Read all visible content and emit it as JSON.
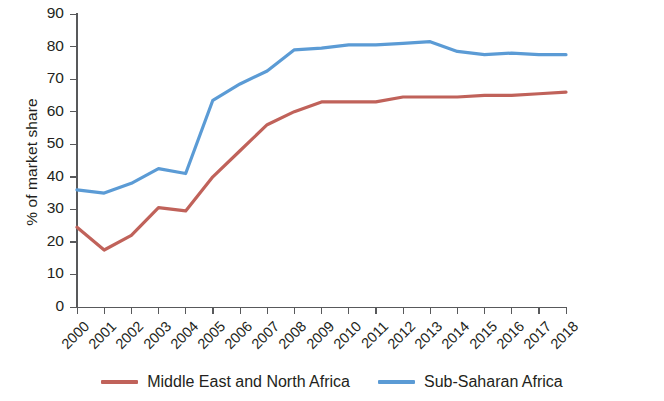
{
  "chart_data": {
    "type": "line",
    "title": "",
    "xlabel": "",
    "ylabel": "% of market share",
    "ylim": [
      0,
      90
    ],
    "ytick_step": 10,
    "yticks": [
      0,
      10,
      20,
      30,
      40,
      50,
      60,
      70,
      80,
      90
    ],
    "grid": false,
    "legend_position": "bottom",
    "categories": [
      "2000",
      "2001",
      "2002",
      "2003",
      "2004",
      "2005",
      "2006",
      "2007",
      "2008",
      "2009",
      "2010",
      "2011",
      "2012",
      "2013",
      "2014",
      "2015",
      "2016",
      "2017",
      "2018"
    ],
    "series": [
      {
        "name": "Middle East and North Africa",
        "color": "#c0625a",
        "values": [
          24.5,
          17.5,
          22,
          30.5,
          29.5,
          40,
          48,
          56,
          60,
          63,
          63,
          63,
          64.5,
          64.5,
          64.5,
          65,
          65,
          65.5,
          66
        ]
      },
      {
        "name": "Sub-Saharan Africa",
        "color": "#5b9bd5",
        "values": [
          36,
          35,
          38,
          42.5,
          41,
          63.5,
          68.5,
          72.5,
          79,
          79.5,
          80.5,
          80.5,
          81,
          81.5,
          78.5,
          77.5,
          78,
          77.5,
          77.5
        ]
      }
    ]
  },
  "axis": {
    "y_title": "% of market share",
    "y_tick_labels": [
      "90",
      "80",
      "70",
      "60",
      "50",
      "40",
      "30",
      "20",
      "10",
      "0"
    ],
    "x_tick_labels": [
      "2000",
      "2001",
      "2002",
      "2003",
      "2004",
      "2005",
      "2006",
      "2007",
      "2008",
      "2009",
      "2010",
      "2011",
      "2012",
      "2013",
      "2014",
      "2015",
      "2016",
      "2017",
      "2018"
    ],
    "axis_color": "#58595b"
  },
  "legend": {
    "items": [
      {
        "label": "Middle East and North Africa",
        "color": "#c0625a"
      },
      {
        "label": "Sub-Saharan Africa",
        "color": "#5b9bd5"
      }
    ]
  }
}
